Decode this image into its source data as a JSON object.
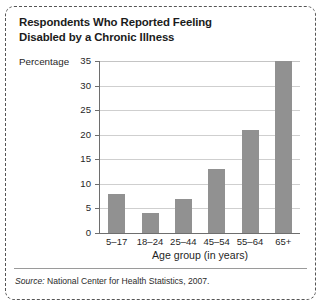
{
  "title": {
    "line1": "Respondents Who Reported Feeling",
    "line2": "Disabled by a Chronic Illness"
  },
  "source": {
    "prefix": "Source:",
    "text": "National Center for Health Statistics, 2007."
  },
  "colors": {
    "bar": "#919191",
    "grid": "#cfcfcf",
    "axis": "#6e6e6e",
    "text": "#1f1f1f",
    "border": "#555555"
  },
  "chart_data": {
    "type": "bar",
    "title": "Respondents Who Reported Feeling Disabled by a Chronic Illness",
    "categories": [
      "5–17",
      "18–24",
      "25–44",
      "45–54",
      "55–64",
      "65+"
    ],
    "values": [
      8,
      4,
      7,
      13,
      21,
      35
    ],
    "xlabel": "Age group (in years)",
    "ylabel": "Percentage",
    "ylim": [
      0,
      35
    ],
    "yticks": [
      0,
      5,
      10,
      15,
      20,
      25,
      30,
      35
    ],
    "ytick_labels": [
      "0",
      "5",
      "10",
      "15",
      "20",
      "25",
      "30",
      "35"
    ],
    "grid": true,
    "legend": false,
    "source": "Source: National Center for Health Statistics, 2007."
  }
}
